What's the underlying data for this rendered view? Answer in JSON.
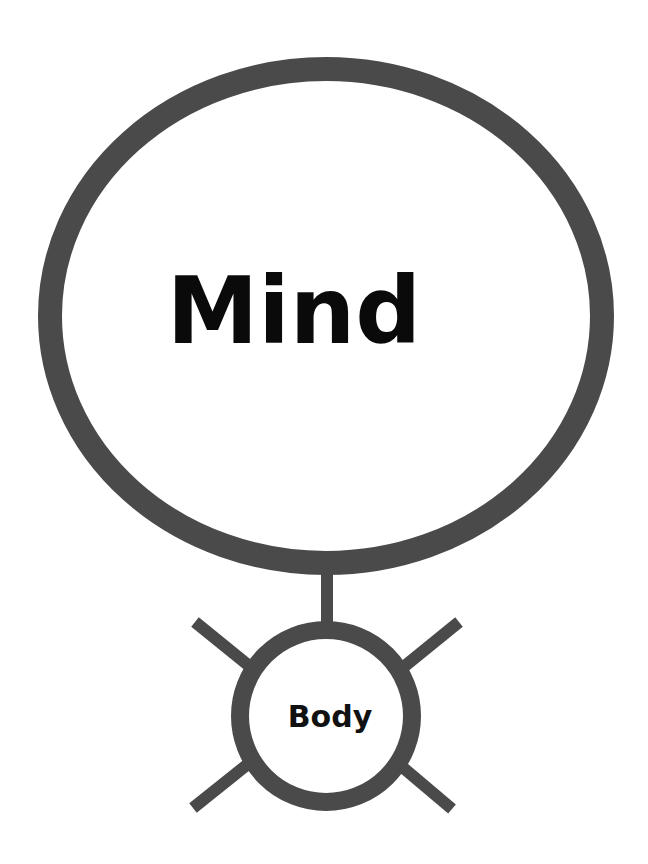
{
  "diagram": {
    "stroke_color": "#4a4a4a",
    "background": "#ffffff",
    "mind": {
      "label": "Mind",
      "cx": 326,
      "cy": 316,
      "rx": 276,
      "ry": 247,
      "stroke_width": 24
    },
    "connector": {
      "x": 327,
      "y1": 560,
      "y2": 626,
      "width": 12
    },
    "body": {
      "label": "Body",
      "cx": 326,
      "cy": 716,
      "r": 86,
      "stroke_width": 18
    },
    "limbs": [
      {
        "name": "upper-left",
        "x1": 195,
        "y1": 622,
        "x2": 258,
        "y2": 673
      },
      {
        "name": "upper-right",
        "x1": 459,
        "y1": 622,
        "x2": 395,
        "y2": 674
      },
      {
        "name": "lower-left",
        "x1": 193,
        "y1": 808,
        "x2": 258,
        "y2": 756
      },
      {
        "name": "lower-right",
        "x1": 452,
        "y1": 809,
        "x2": 394,
        "y2": 760
      }
    ]
  }
}
